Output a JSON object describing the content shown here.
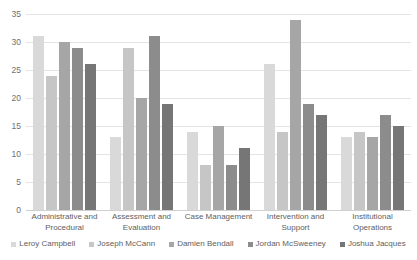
{
  "chart_data": {
    "type": "bar",
    "title": "",
    "subtitle": "",
    "xlabel": "",
    "ylabel": "",
    "ylim": [
      0,
      35
    ],
    "ytick_step": 5,
    "yticks": [
      0,
      5,
      10,
      15,
      20,
      25,
      30,
      35
    ],
    "grid": true,
    "legend_position": "bottom",
    "categories": [
      "Administrative and Procedural",
      "Assessment and Evaluation",
      "Case Management",
      "Intervention and Support",
      "Institutional Operations"
    ],
    "series": [
      {
        "name": "Leroy Campbell",
        "color": "#d9d9d9",
        "values": [
          31,
          13,
          14,
          26,
          13
        ]
      },
      {
        "name": "Joseph McCann",
        "color": "#c6c6c6",
        "values": [
          24,
          29,
          8,
          14,
          14
        ]
      },
      {
        "name": "Damien Bendall",
        "color": "#a6a6a6",
        "values": [
          30,
          20,
          15,
          34,
          13
        ]
      },
      {
        "name": "Jordan McSweeney",
        "color": "#8c8c8c",
        "values": [
          29,
          31,
          8,
          19,
          17
        ]
      },
      {
        "name": "Joshua Jacques",
        "color": "#767676",
        "values": [
          26,
          19,
          11,
          17,
          15
        ]
      }
    ]
  }
}
